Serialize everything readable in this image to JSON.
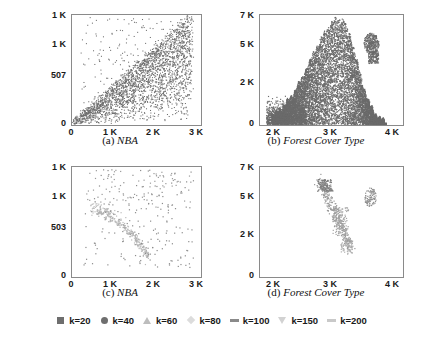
{
  "figure": {
    "background": "#ffffff",
    "axis_color": "#8a8a8a",
    "text_color": "#1a1a1a"
  },
  "chart_data": [
    {
      "id": "a",
      "type": "scatter",
      "title": "(a) NBA",
      "caption_label": "(a)",
      "caption_name": "NBA",
      "dataset": "NBA",
      "xlabel": "",
      "ylabel": "",
      "xlim": [
        0,
        3000
      ],
      "ylim": [
        0,
        1014
      ],
      "xticks": [
        0,
        1000,
        2000,
        3000
      ],
      "xticklabels": [
        "0",
        "1 K",
        "2 K",
        "3 K"
      ],
      "yticks": [
        0,
        507,
        1000,
        1014
      ],
      "yticklabels": [
        "0",
        "507",
        "1 K",
        "1 K"
      ],
      "grid": false,
      "point_color": "#6e6e6e",
      "density": "very-high",
      "shape_description": "dense wedge fanning out from the origin toward upper right, widest near x=700-1500",
      "n_points": 2600
    },
    {
      "id": "b",
      "type": "scatter",
      "title": "(b) Forest Cover Type",
      "caption_label": "(b)",
      "caption_name": "Forest Cover Type",
      "dataset": "Forest Cover Type",
      "xlabel": "",
      "ylabel": "",
      "xlim": [
        1700,
        4000
      ],
      "ylim": [
        0,
        7000
      ],
      "xticks": [
        2000,
        3000,
        4000
      ],
      "xticklabels": [
        "2 K",
        "3 K",
        "4 K"
      ],
      "yticks": [
        0,
        2000,
        5000,
        7000
      ],
      "yticklabels": [
        "0",
        "2 K",
        "5 K",
        "7 K"
      ],
      "grid": false,
      "point_color": "#6b6b6b",
      "density": "solid",
      "shape_description": "solid dark flame-shaped blob peaking near x=3K y=6.7K, plus small detached satellite cluster near x=3.6K y=5.2K",
      "n_points": 3000
    },
    {
      "id": "c",
      "type": "scatter",
      "title": "(c) NBA",
      "caption_label": "(c)",
      "caption_name": "NBA",
      "dataset": "NBA",
      "xlabel": "",
      "ylabel": "",
      "xlim": [
        0,
        3000
      ],
      "ylim": [
        0,
        1006
      ],
      "xticks": [
        0,
        1000,
        2000,
        3000
      ],
      "xticklabels": [
        "0",
        "1 K",
        "2 K",
        "3 K"
      ],
      "yticks": [
        0,
        503,
        1000,
        1006
      ],
      "yticklabels": [
        "0",
        "503",
        "1 K",
        "1 K"
      ],
      "grid": false,
      "point_color": "#a8a8a8",
      "density": "sparse",
      "shape_description": "sparse arc of light points curving from upper-left down to x=1.8K, with scattered outliers to the right",
      "n_points": 430
    },
    {
      "id": "d",
      "type": "scatter",
      "title": "(d) Forest Cover Type",
      "caption_label": "(d)",
      "caption_name": "Forest Cover Type",
      "dataset": "Forest Cover Type",
      "xlabel": "",
      "ylabel": "",
      "xlim": [
        1700,
        4000
      ],
      "ylim": [
        0,
        7000
      ],
      "xticks": [
        2000,
        3000,
        4000
      ],
      "xticklabels": [
        "2 K",
        "3 K",
        "4 K"
      ],
      "yticks": [
        0,
        2000,
        5000,
        7000
      ],
      "yticklabels": [
        "0",
        "2 K",
        "5 K",
        "7 K"
      ],
      "grid": false,
      "point_color": "#9a9a9a",
      "density": "sparse",
      "shape_description": "thin diagonal ridge of light points from x=3.0K y=6.5K down to x=3.5K y=1.5K, plus small detached cluster near x=3.6K y=5.2K",
      "n_points": 260
    }
  ],
  "legend": {
    "position": "bottom",
    "items": [
      {
        "label": "k=20",
        "marker": "square",
        "color": "#6e6e6e"
      },
      {
        "label": "k=40",
        "marker": "circle",
        "color": "#6e6e6e"
      },
      {
        "label": "k=60",
        "marker": "triangle",
        "color": "#bdbdbd"
      },
      {
        "label": "k=80",
        "marker": "diamond",
        "color": "#dcdcdc"
      },
      {
        "label": "k=100",
        "marker": "dash",
        "color": "#8a8a8a"
      },
      {
        "label": "k=150",
        "marker": "triangle-down",
        "color": "#d2d2d2"
      },
      {
        "label": "k=200",
        "marker": "dash",
        "color": "#c9c9c9"
      }
    ]
  }
}
